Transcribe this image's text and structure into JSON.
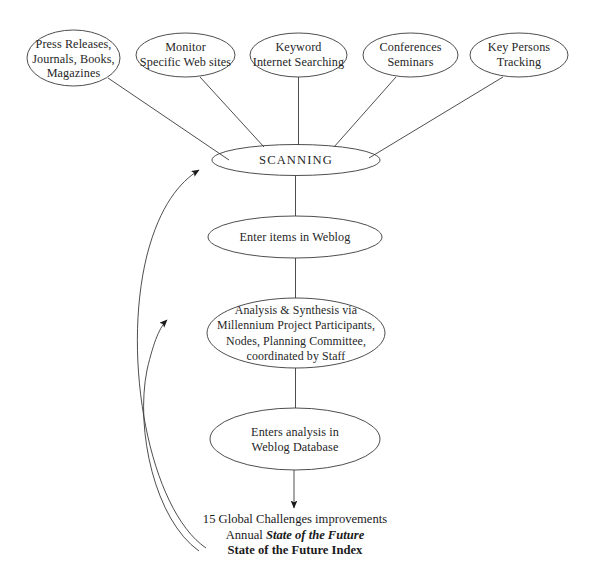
{
  "diagram": {
    "stroke_color": "#3a3a3a",
    "text_color": "#262626",
    "background": "#ffffff",
    "sources": [
      {
        "id": "press-releases",
        "label": "Press Releases,\nJournals, Books,\nMagazines"
      },
      {
        "id": "monitor-web-sites",
        "label": "Monitor\nSpecific Web sites"
      },
      {
        "id": "keyword-searching",
        "label": "Keyword\nInternet Searching"
      },
      {
        "id": "conferences-seminars",
        "label": "Conferences\nSeminars"
      },
      {
        "id": "key-persons-tracking",
        "label": "Key Persons\nTracking"
      }
    ],
    "process": [
      {
        "id": "scanning",
        "label": "SCANNING"
      },
      {
        "id": "enter-items",
        "label": "Enter items in Weblog"
      },
      {
        "id": "analysis-synthesis",
        "label": "Analysis & Synthesis via\nMillennium Project Participants,\nNodes, Planning Committee,\ncoordinated by Staff"
      },
      {
        "id": "enters-analysis",
        "label": "Enters analysis in\nWeblog Database"
      }
    ],
    "outcome": {
      "line1": "15 Global Challenges improvements",
      "line2_prefix": "Annual ",
      "line2_emphasis": "State of the Future",
      "line3": "State of the Future Index"
    }
  }
}
